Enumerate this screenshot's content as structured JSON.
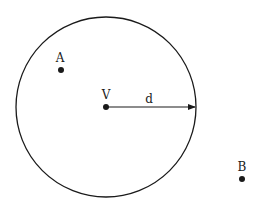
{
  "diagram": {
    "circle": {
      "cx": 106,
      "cy": 107,
      "r": 90,
      "stroke": "#1a1a1a"
    },
    "center_point": {
      "label": "V",
      "x": 106,
      "y": 107
    },
    "radius_label": "d",
    "points": [
      {
        "label": "A",
        "x": 61,
        "y": 70
      },
      {
        "label": "B",
        "x": 242,
        "y": 179
      }
    ]
  }
}
